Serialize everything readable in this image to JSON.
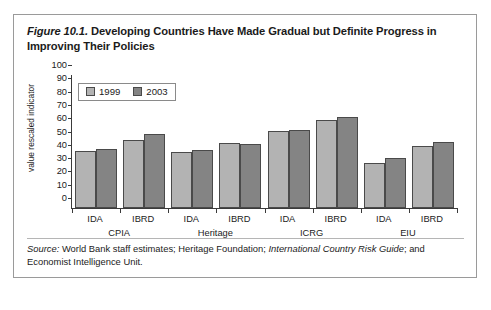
{
  "figure": {
    "label": "Figure 10.1.",
    "title": "Developing Countries Have Made Gradual but Definite Progress in Improving Their Policies",
    "source_prefix": "Source:",
    "source_part1": " World Bank staff estimates; Heritage Foundation; ",
    "source_italic": "International Country Risk Guide",
    "source_part2": "; and Economist Intelligence Unit."
  },
  "legend": {
    "items": [
      {
        "label": "1999",
        "color": "#b3b3b3"
      },
      {
        "label": "2003",
        "color": "#848484"
      }
    ]
  },
  "axis": {
    "y_title": "value rescaled indicator",
    "y_ticks": [
      "0",
      "10",
      "20",
      "30",
      "40",
      "50",
      "60",
      "70",
      "80",
      "90",
      "100"
    ]
  },
  "chart_data": {
    "type": "bar",
    "title": "Developing Countries Have Made Gradual but Definite Progress in Improving Their Policies",
    "xlabel": "",
    "ylabel": "value rescaled indicator",
    "ylim": [
      0,
      100
    ],
    "ytick_step": 10,
    "grid": false,
    "legend_position": "top-left-inside",
    "categories": [
      "IDA",
      "IBRD",
      "IDA",
      "IBRD",
      "IDA",
      "IBRD",
      "IDA",
      "IBRD"
    ],
    "groups": [
      {
        "name": "CPIA",
        "categories": [
          "IDA",
          "IBRD"
        ]
      },
      {
        "name": "Heritage",
        "categories": [
          "IDA",
          "IBRD"
        ]
      },
      {
        "name": "ICRG",
        "categories": [
          "IDA",
          "IBRD"
        ]
      },
      {
        "name": "EIU",
        "categories": [
          "IDA",
          "IBRD"
        ]
      }
    ],
    "series": [
      {
        "name": "1999",
        "color": "#b3b3b3",
        "values": [
          43,
          51,
          42,
          49,
          58,
          66.5,
          34,
          46.5
        ]
      },
      {
        "name": "2003",
        "color": "#848484",
        "values": [
          44.5,
          55.5,
          43.5,
          48.5,
          58.5,
          68.5,
          37.5,
          50
        ]
      }
    ]
  }
}
